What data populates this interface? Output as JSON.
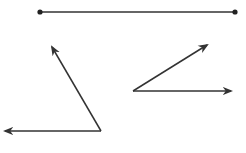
{
  "diagram": {
    "stroke_color": "#333333",
    "segment": {
      "type": "line-segment",
      "endpoints": [
        [
          40,
          12
        ],
        [
          235,
          12
        ]
      ]
    },
    "angles": [
      {
        "name": "obtuse-left-angle",
        "vertex": [
          101,
          131
        ],
        "rays": [
          [
            52,
            47
          ],
          [
            5,
            131
          ]
        ]
      },
      {
        "name": "acute-right-angle",
        "vertex": [
          133,
          91
        ],
        "rays": [
          [
            207,
            45
          ],
          [
            231,
            91
          ]
        ]
      }
    ]
  }
}
